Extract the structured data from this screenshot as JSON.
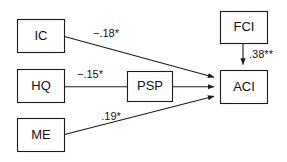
{
  "diagram": {
    "type": "path-model",
    "background_color": "#ffffff",
    "line_color": "#1a1a1a",
    "text_color": "#111111",
    "nodes": [
      {
        "id": "IC",
        "label": "IC",
        "x": 17,
        "y": 19,
        "w": 47,
        "h": 33
      },
      {
        "id": "HQ",
        "label": "HQ",
        "x": 17,
        "y": 69,
        "w": 47,
        "h": 33
      },
      {
        "id": "ME",
        "label": "ME",
        "x": 17,
        "y": 118,
        "w": 47,
        "h": 33
      },
      {
        "id": "PSP",
        "label": "PSP",
        "x": 127,
        "y": 71,
        "w": 45,
        "h": 30
      },
      {
        "id": "FCI",
        "label": "FCI",
        "x": 220,
        "y": 11,
        "w": 47,
        "h": 32
      },
      {
        "id": "ACI",
        "label": "ACI",
        "x": 220,
        "y": 70,
        "w": 47,
        "h": 33
      }
    ],
    "edges": [
      {
        "id": "ic-aci",
        "from": "IC",
        "to": "ACI",
        "label": "−.18*",
        "label_x": 106,
        "label_y": 34
      },
      {
        "id": "hq-aci",
        "from": "HQ",
        "to": "ACI",
        "label": "−.15*",
        "label_x": 90,
        "label_y": 75,
        "through": "PSP"
      },
      {
        "id": "me-aci",
        "from": "ME",
        "to": "ACI",
        "label": ".19*",
        "label_x": 111,
        "label_y": 117
      },
      {
        "id": "fci-aci",
        "from": "FCI",
        "to": "ACI",
        "label": ".38**",
        "label_x": 260,
        "label_y": 55
      }
    ]
  }
}
